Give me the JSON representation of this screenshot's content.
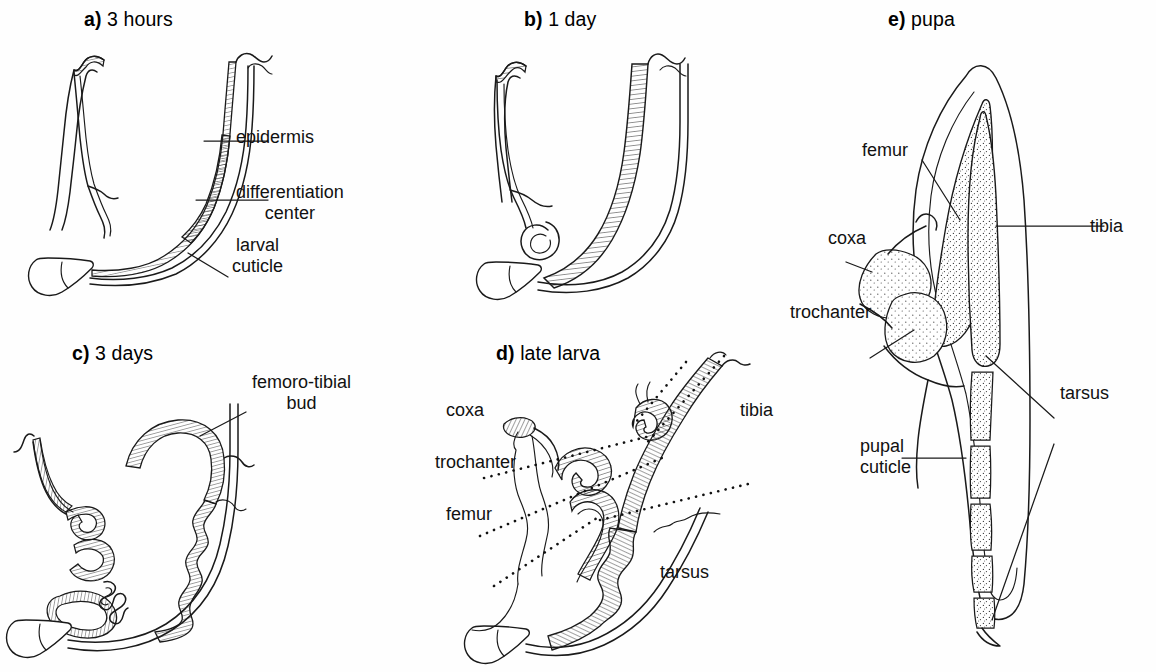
{
  "figure": {
    "kind": "scientific-line-diagram",
    "background_color": "#ffffff",
    "ink_color": "#1a1a1a"
  },
  "panels": [
    {
      "id": "a",
      "marker": "a)",
      "title": "3 hours",
      "labels": [
        {
          "name": "epidermis",
          "text": "epidermis"
        },
        {
          "name": "differentiation-center",
          "line1": "differentiation",
          "line2": "center"
        },
        {
          "name": "larval-cuticle",
          "line1": "larval",
          "line2": "cuticle"
        }
      ]
    },
    {
      "id": "b",
      "marker": "b)",
      "title": "1 day",
      "labels": []
    },
    {
      "id": "c",
      "marker": "c)",
      "title": "3 days",
      "labels": [
        {
          "name": "femoro-tibial-bud",
          "line1": "femoro-tibial",
          "line2": "bud"
        }
      ]
    },
    {
      "id": "d",
      "marker": "d)",
      "title": "late larva",
      "labels": [
        {
          "name": "coxa",
          "text": "coxa"
        },
        {
          "name": "trochanter",
          "text": "trochanter"
        },
        {
          "name": "femur",
          "text": "femur"
        },
        {
          "name": "tibia",
          "text": "tibia"
        },
        {
          "name": "tarsus",
          "text": "tarsus"
        }
      ]
    },
    {
      "id": "e",
      "marker": "e)",
      "title": "pupa",
      "labels": [
        {
          "name": "femur",
          "text": "femur"
        },
        {
          "name": "coxa",
          "text": "coxa"
        },
        {
          "name": "trochanter",
          "text": "trochanter"
        },
        {
          "name": "tibia",
          "text": "tibia"
        },
        {
          "name": "tarsus",
          "text": "tarsus"
        },
        {
          "name": "pupal-cuticle",
          "line1": "pupal",
          "line2": "cuticle"
        }
      ]
    }
  ],
  "text": {
    "a_marker": "a)",
    "a_title": " 3 hours",
    "b_marker": "b)",
    "b_title": " 1 day",
    "c_marker": "c)",
    "c_title": " 3 days",
    "d_marker": "d)",
    "d_title": " late larva",
    "e_marker": "e)",
    "e_title": " pupa",
    "epidermis": "epidermis",
    "diffcenter_1": "differentiation",
    "diffcenter_2": "center",
    "larvalcuticle_1": "larval",
    "larvalcuticle_2": "cuticle",
    "femorotibial_1": "femoro-tibial",
    "femorotibial_2": "bud",
    "d_coxa": "coxa",
    "d_trochanter": "trochanter",
    "d_femur": "femur",
    "d_tibia": "tibia",
    "d_tarsus": "tarsus",
    "e_femur": "femur",
    "e_coxa": "coxa",
    "e_trochanter": "trochanter",
    "e_tibia": "tibia",
    "e_tarsus": "tarsus",
    "e_pupal_1": "pupal",
    "e_pupal_2": "cuticle"
  }
}
